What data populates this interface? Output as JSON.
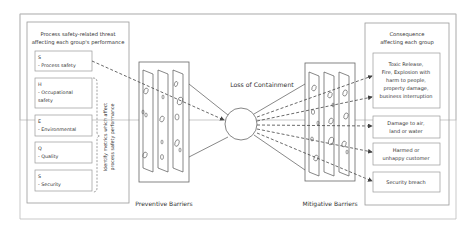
{
  "left_panel": {
    "title_line1": "Process safety-related threat",
    "title_line2": "affecting each group's performance",
    "groups": [
      {
        "code": "S",
        "name_line1": "- Process safety",
        "name_line2": ""
      },
      {
        "code": "H",
        "name_line1": "- Occupational",
        "name_line2": "safety"
      },
      {
        "code": "E",
        "name_line1": "- Environmental",
        "name_line2": ""
      },
      {
        "code": "Q",
        "name_line1": "- Quality",
        "name_line2": ""
      },
      {
        "code": "S",
        "name_line1": "- Security",
        "name_line2": ""
      }
    ],
    "bracket_note_line1": "Identify metrics which affect",
    "bracket_note_line2": "process safety performance"
  },
  "center": {
    "event_label": "Loss of Containment",
    "preventive_label": "Preventive Barriers",
    "mitigative_label": "Mitigative Barriers"
  },
  "right_panel": {
    "title_line1": "Consequence",
    "title_line2": "affecting each group",
    "consequences": [
      {
        "lines": [
          "Toxic Release,",
          "Fire, Explosion with",
          "harm to people,",
          "property damage,",
          "business interruption"
        ]
      },
      {
        "lines": [
          "Damage to air,",
          "land or water"
        ]
      },
      {
        "lines": [
          "Harmed or",
          "unhappy customer"
        ]
      },
      {
        "lines": [
          "Security breach"
        ]
      }
    ]
  }
}
